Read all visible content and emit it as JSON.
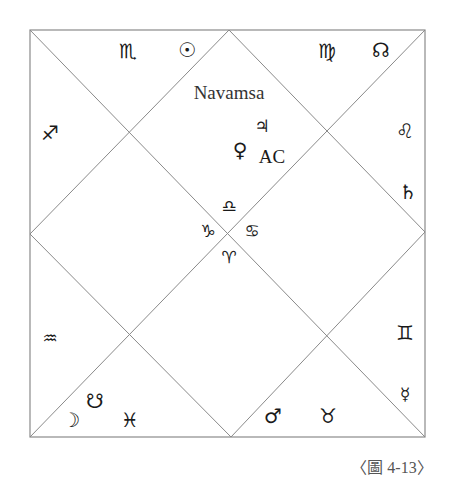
{
  "chart": {
    "title": "Navamsa",
    "caption": "〈圖 4-13〉",
    "line_color": "#8a8a8a",
    "text_color": "#1a1a1a",
    "frame": {
      "left": 30,
      "top": 30,
      "right": 425,
      "bottom": 437
    }
  },
  "houses": {
    "top_left": {
      "sign": "♏",
      "sign_name": "Scorpio",
      "planets": [
        {
          "symbol": "☉",
          "name": "Sun"
        }
      ]
    },
    "top_right": {
      "sign": "♍",
      "sign_name": "Virgo",
      "planets": [
        {
          "symbol": "☊",
          "name": "North Node"
        }
      ]
    },
    "top_center": {
      "sign": "♎",
      "sign_name": "Libra",
      "planets": [
        {
          "symbol": "♃",
          "name": "Jupiter"
        },
        {
          "symbol": "♀",
          "name": "Venus"
        }
      ],
      "label": "AC"
    },
    "left_upper": {
      "sign": "♐",
      "sign_name": "Sagittarius",
      "planets": []
    },
    "right_upper": {
      "sign": "♌",
      "sign_name": "Leo",
      "planets": [
        {
          "symbol": "♄",
          "name": "Saturn"
        }
      ]
    },
    "center_left": {
      "sign": "♑",
      "sign_name": "Capricorn",
      "planets": []
    },
    "center_right": {
      "sign": "♋",
      "sign_name": "Cancer",
      "planets": []
    },
    "bottom_center": {
      "sign": "♈",
      "sign_name": "Aries",
      "planets": []
    },
    "left_lower": {
      "sign": "♒",
      "sign_name": "Aquarius",
      "planets": []
    },
    "right_lower": {
      "sign": "♊",
      "sign_name": "Gemini",
      "planets": [
        {
          "symbol": "☿",
          "name": "Mercury"
        }
      ]
    },
    "bottom_left": {
      "sign": "♓",
      "sign_name": "Pisces",
      "planets": [
        {
          "symbol": "☋",
          "name": "South Node"
        },
        {
          "symbol": "☽",
          "name": "Moon"
        }
      ]
    },
    "bottom_right": {
      "sign": "♉",
      "sign_name": "Taurus",
      "planets": [
        {
          "symbol": "♂",
          "name": "Mars"
        }
      ]
    }
  }
}
